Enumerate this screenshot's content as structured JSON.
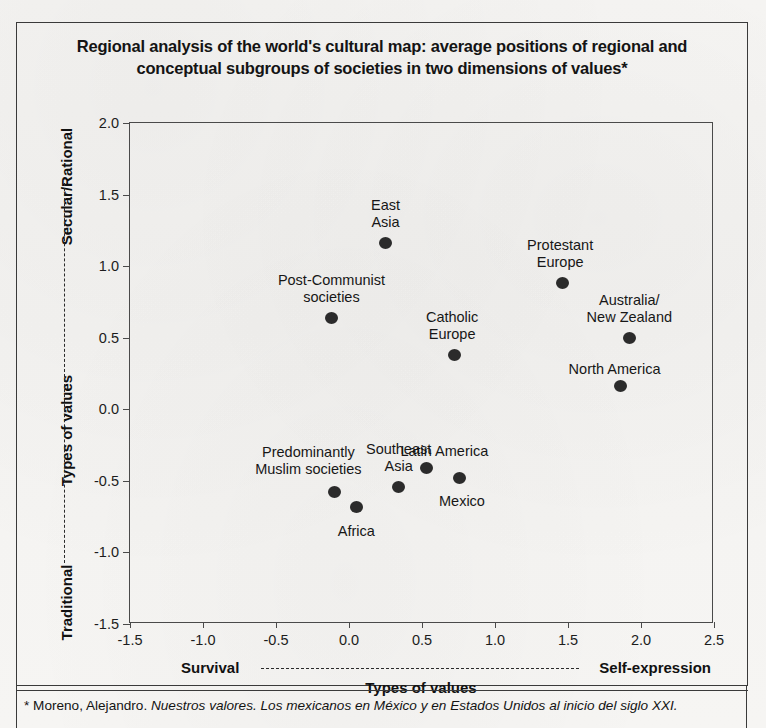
{
  "title": {
    "line1": "Regional analysis of the world's cultural map: average positions of regional and",
    "line2": "conceptual subgroups of societies in two dimensions of values*"
  },
  "axes": {
    "y_top_label": "Secular/Rational",
    "y_middle_label": "Types of values",
    "y_bottom_label": "Traditional",
    "x_left_label": "Survival",
    "x_right_label": "Self-expression",
    "x_center_label": "Types of values"
  },
  "footnote": {
    "marker": "*",
    "author": "Moreno, Alejandro.",
    "work": "Nuestros  valores. Los mexicanos en México y en Estados Unidos al inicio del siglo XXI."
  },
  "chart_data": {
    "type": "scatter",
    "title": "Regional analysis of the world's cultural map: average positions of regional and conceptual subgroups of societies in two dimensions of values*",
    "xlabel": "Types of values",
    "ylabel": "Types of values",
    "xlim": [
      -1.5,
      2.5
    ],
    "ylim": [
      -1.5,
      2.0
    ],
    "xticks": [
      "-1.5",
      "-1.0",
      "-0.5",
      "0.0",
      "0.5",
      "1.0",
      "1.5",
      "2.0",
      "2.5"
    ],
    "xtick_values": [
      -1.5,
      -1.0,
      -0.5,
      0.0,
      0.5,
      1.0,
      1.5,
      2.0,
      2.5
    ],
    "yticks": [
      "2.0",
      "1.5",
      "1.0",
      "0.5",
      "0.0",
      "-0.5",
      "-1.0",
      "-1.5"
    ],
    "ytick_values": [
      2.0,
      1.5,
      1.0,
      0.5,
      0.0,
      -0.5,
      -1.0,
      -1.5
    ],
    "grid": false,
    "legend": "none",
    "x_axis_poles": [
      "Survival",
      "Self-expression"
    ],
    "y_axis_poles": [
      "Traditional",
      "Secular/Rational"
    ],
    "marker_color": "#2b2b2b",
    "points": [
      {
        "label": "East\nAsia",
        "x": 0.25,
        "y": 1.16,
        "label_dx": 0,
        "label_dy": -46
      },
      {
        "label": "Post-Communist\nsocieties",
        "x": -0.12,
        "y": 0.64,
        "label_dx": 0,
        "label_dy": -46
      },
      {
        "label": "Catholic\nEurope",
        "x": 0.72,
        "y": 0.38,
        "label_dx": -2,
        "label_dy": -46
      },
      {
        "label": "Protestant\nEurope",
        "x": 1.46,
        "y": 0.88,
        "label_dx": -2,
        "label_dy": -46
      },
      {
        "label": "Australia/\nNew Zealand",
        "x": 1.92,
        "y": 0.5,
        "label_dx": 0,
        "label_dy": -46
      },
      {
        "label": "North America",
        "x": 1.86,
        "y": 0.16,
        "label_dx": -6,
        "label_dy": -25
      },
      {
        "label": "Predominantly\nMuslim societies",
        "x": -0.1,
        "y": -0.58,
        "label_dx": -26,
        "label_dy": -48
      },
      {
        "label": "Africa",
        "x": 0.05,
        "y": -0.68,
        "label_dx": 0,
        "label_dy": 16
      },
      {
        "label": "Southeast\nAsia",
        "x": 0.34,
        "y": -0.54,
        "label_dx": 0,
        "label_dy": -46
      },
      {
        "label": "Latin America",
        "x": 0.53,
        "y": -0.41,
        "label_dx": 18,
        "label_dy": -25
      },
      {
        "label": "Mexico",
        "x": 0.76,
        "y": -0.48,
        "label_dx": 2,
        "label_dy": 15
      }
    ]
  }
}
